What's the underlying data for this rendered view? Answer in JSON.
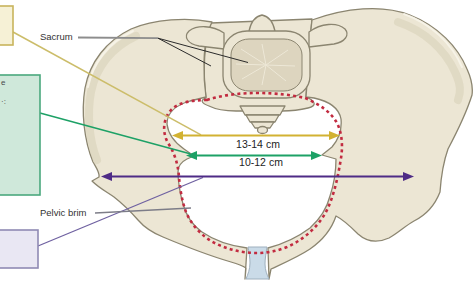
{
  "figure": {
    "background": "#ffffff",
    "annotations": {
      "sacrum_label": "Sacrum",
      "pelvic_brim_label": "Pelvic brim"
    },
    "measurements": [
      {
        "id": "inlet-upper-diameter",
        "label": "13-14 cm",
        "color": "#d2b232"
      },
      {
        "id": "inlet-lower-diameter",
        "label": "10-12 cm",
        "color": "#1da166"
      },
      {
        "id": "widest-transverse-diameter",
        "label": "",
        "color": "#4e2b86"
      }
    ],
    "legend_boxes": [
      {
        "id": "yellow-box",
        "fill": "#f6f1d6",
        "border": "#c9b45c",
        "partial_text": ""
      },
      {
        "id": "green-box",
        "fill": "#cfe8da",
        "border": "#4aa87d",
        "partial_text_line1": "e",
        "partial_text_line2": "·:"
      },
      {
        "id": "purple-box",
        "fill": "#e9e7f3",
        "border": "#8f8ab3",
        "partial_text": ""
      }
    ],
    "colors": {
      "background": "#ffffff",
      "bone_fill": "#ece6d4",
      "bone_inner": "#ddd5bf",
      "bone_outline": "#8b8570",
      "bone_shade": "#d7cfb6",
      "red_dashed_brim": "#c22b40",
      "yellow_arrow": "#d2b232",
      "yellow_pointer": "#ccbd6a",
      "green_arrow": "#1da166",
      "purple_arrow": "#4e2b86",
      "purple_pointer": "#6f61a1",
      "symphysis_fill": "#cadbe8",
      "yellow_box_fill": "#f6f1d6",
      "yellow_box_border": "#c9b45c",
      "green_box_fill": "#cfe8da",
      "green_box_border": "#4aa87d",
      "purple_box_fill": "#e9e7f3",
      "purple_box_border": "#8f8ab3",
      "label_text": "#333333",
      "pointer_gray": "#7d7d88"
    }
  }
}
